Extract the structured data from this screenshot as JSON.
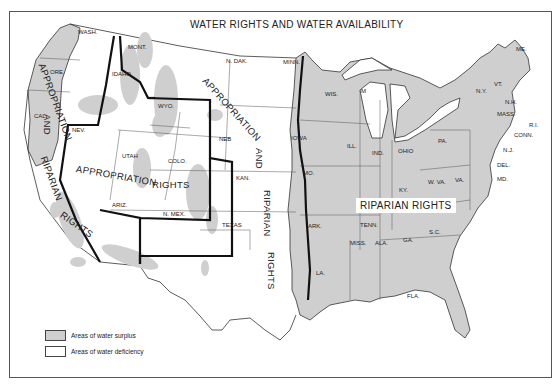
{
  "title": "WATER RIGHTS AND WATER AVAILABILITY",
  "colors": {
    "surplus": "#cfcfcf",
    "deficiency": "#ffffff",
    "border": "#333333",
    "region_boundary": "#111111"
  },
  "regions": {
    "west_coast": [
      "APPROPRIATION",
      "AND",
      "RIPARIAN",
      "RIGHTS"
    ],
    "interior_west": [
      "APPROPRIATION",
      "RIGHTS"
    ],
    "plains": [
      "APPROPRIATION",
      "AND",
      "RIPARIAN",
      "RIGHTS"
    ],
    "east": "RIPARIAN RIGHTS"
  },
  "states": [
    "WASH.",
    "ORE.",
    "CAL.",
    "IDAHO",
    "MONT.",
    "NEV.",
    "UTAH",
    "WYO.",
    "COLO.",
    "ARIZ.",
    "N. MEX.",
    "N. DAK.",
    "NEB",
    "KAN.",
    "TEXAS",
    "MINN.",
    "IOWA",
    "MO.",
    "ARK.",
    "LA.",
    "WIS.",
    "ILL.",
    "M",
    "IND.",
    "OHIO",
    "KY.",
    "TENN.",
    "MISS.",
    "ALA.",
    "GA.",
    "FLA.",
    "S.C.",
    "N.C.",
    "W. VA.",
    "VA.",
    "PA.",
    "N.Y.",
    "VT.",
    "N.H.",
    "ME.",
    "MASS.",
    "R.I.",
    "CONN.",
    "N.J.",
    "DEL.",
    "MD."
  ],
  "legend": [
    {
      "label": "Areas of water surplus",
      "swatch": "surplus"
    },
    {
      "label": "Areas of water deficiency",
      "swatch": "deficiency"
    }
  ]
}
